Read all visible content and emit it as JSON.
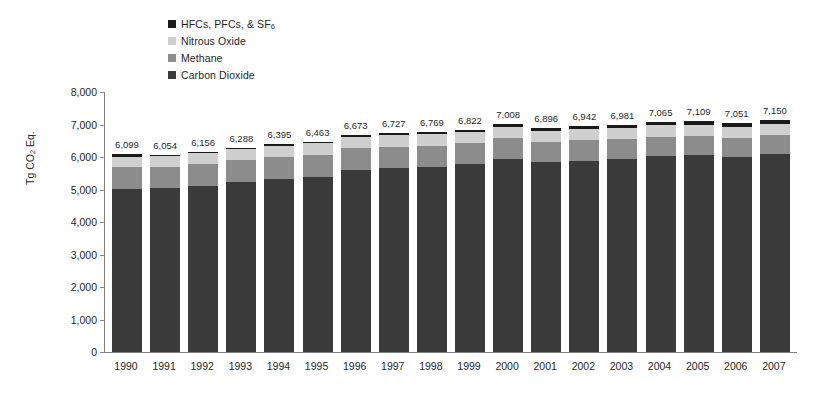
{
  "chart_data": {
    "type": "bar",
    "stacked": true,
    "title": "",
    "xlabel": "",
    "ylabel": "Tg CO2 Eq.",
    "ylabel_parts": {
      "pre": "Tg CO",
      "sub": "2",
      "post": " Eq."
    },
    "ylim": [
      0,
      8000
    ],
    "ytick_values": [
      0,
      1000,
      2000,
      3000,
      4000,
      5000,
      6000,
      7000,
      8000
    ],
    "ytick_labels": [
      "0",
      "1,000",
      "2,000",
      "3,000",
      "4,000",
      "5,000",
      "6,000",
      "7,000",
      "8,000"
    ],
    "grid": false,
    "legend_position": "top-center",
    "categories": [
      "1990",
      "1991",
      "1992",
      "1993",
      "1994",
      "1995",
      "1996",
      "1997",
      "1998",
      "1999",
      "2000",
      "2001",
      "2002",
      "2003",
      "2004",
      "2005",
      "2006",
      "2007"
    ],
    "series": [
      {
        "name": "Carbon Dioxide",
        "color": "#3a3a3a",
        "values": [
          5013,
          5039,
          5121,
          5243,
          5328,
          5399,
          5612,
          5673,
          5703,
          5781,
          5953,
          5851,
          5891,
          5940,
          6022,
          6063,
          6005,
          6103
        ]
      },
      {
        "name": "Methane",
        "color": "#8c8c8c",
        "values": [
          672,
          666,
          665,
          655,
          659,
          664,
          661,
          650,
          644,
          638,
          628,
          624,
          619,
          612,
          605,
          594,
          591,
          585
        ]
      },
      {
        "name": "Nitrous Oxide",
        "color": "#cfcfcf",
        "values": [
          320,
          314,
          334,
          342,
          359,
          355,
          352,
          356,
          349,
          346,
          343,
          341,
          341,
          337,
          344,
          338,
          334,
          334
        ]
      },
      {
        "name": "HFCs, PFCs, & SF6",
        "color": "#1a1a1a",
        "values": [
          94,
          35,
          36,
          48,
          49,
          45,
          48,
          48,
          73,
          57,
          84,
          80,
          91,
          92,
          94,
          114,
          121,
          128
        ]
      }
    ],
    "totals": [
      6099,
      6054,
      6156,
      6288,
      6395,
      6463,
      6673,
      6727,
      6769,
      6822,
      7008,
      6896,
      6942,
      6981,
      7065,
      7109,
      7051,
      7150
    ],
    "total_labels": [
      "6,099",
      "6,054",
      "6,156",
      "6,288",
      "6,395",
      "6,463",
      "6,673",
      "6,727",
      "6,769",
      "6,822",
      "7,008",
      "6,896",
      "6,942",
      "6,981",
      "7,065",
      "7,109",
      "7,051",
      "7,150"
    ]
  },
  "legend": {
    "items": [
      {
        "label_pre": "HFCs, PFCs, & SF",
        "label_sub": "6",
        "label_post": "",
        "color": "#1a1a1a"
      },
      {
        "label_pre": "Nitrous Oxide",
        "label_sub": "",
        "label_post": "",
        "color": "#cfcfcf"
      },
      {
        "label_pre": "Methane",
        "label_sub": "",
        "label_post": "",
        "color": "#8c8c8c"
      },
      {
        "label_pre": "Carbon Dioxide",
        "label_sub": "",
        "label_post": "",
        "color": "#3a3a3a"
      }
    ]
  }
}
